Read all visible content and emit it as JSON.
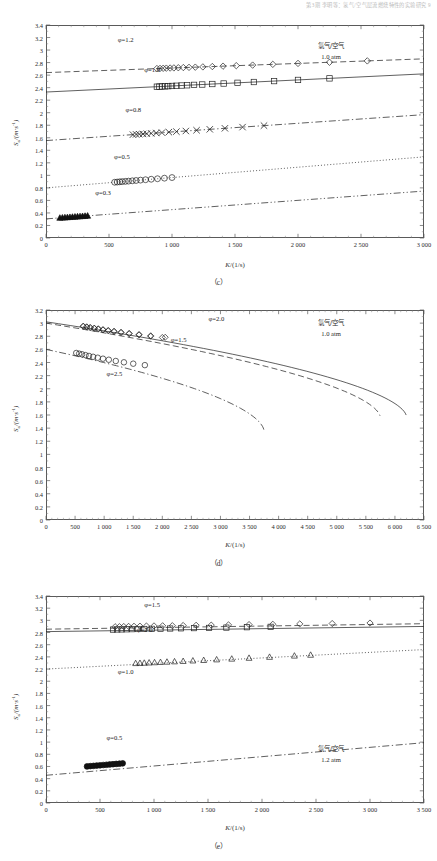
{
  "header": {
    "running_head": "第3期    李明等：氢气/空气层流燃烧特性的实验研究    9"
  },
  "figure": {
    "panels": [
      {
        "id": "c",
        "caption": "（c）",
        "xlabel_sym": "K",
        "xlabel_unit": "/(1/s)",
        "ylabel_sym": "S",
        "ylabel_sub": "u",
        "ylabel_unit": "/(m·s",
        "ylabel_sup": "-1",
        "ylabel_close": ")",
        "note_line1": "氢气/空气",
        "note_line2": "1.0 atm",
        "xticks": [
          "0",
          "500",
          "1 000",
          "1 500",
          "2 000",
          "2 500",
          "3 000"
        ],
        "yticks": [
          "0",
          "0.2",
          "0.4",
          "0.6",
          "0.8",
          "1",
          "1.2",
          "1.4",
          "1.6",
          "1.8",
          "2",
          "2.2",
          "2.4",
          "2.6",
          "2.8",
          "3",
          "3.2",
          "3.4"
        ],
        "series_labels": [
          {
            "text": "φ=1.2",
            "x": 0.19,
            "y": 0.93
          },
          {
            "text": "φ=1.0",
            "x": 0.26,
            "y": 0.79
          },
          {
            "text": "φ=0.8",
            "x": 0.21,
            "y": 0.6
          },
          {
            "text": "φ=0.5",
            "x": 0.18,
            "y": 0.38
          },
          {
            "text": "φ=0.3",
            "x": 0.13,
            "y": 0.21
          }
        ]
      },
      {
        "id": "d",
        "caption": "（d）",
        "xlabel_sym": "K",
        "xlabel_unit": "/(1/s)",
        "ylabel_sym": "S",
        "ylabel_sub": "u",
        "ylabel_unit": "/(m·s",
        "ylabel_sup": "-1",
        "ylabel_close": ")",
        "note_line1": "氢气/空气",
        "note_line2": "1.0 atm",
        "xticks": [
          "0",
          "500",
          "1 000",
          "1 500",
          "2 000",
          "2 500",
          "3 000",
          "3 500",
          "4 000",
          "4 500",
          "5 000",
          "5 500",
          "6 000",
          "6 500"
        ],
        "yticks": [
          "0",
          "0.2",
          "0.4",
          "0.6",
          "0.8",
          "1",
          "1.2",
          "1.4",
          "1.6",
          "1.8",
          "2",
          "2.2",
          "2.4",
          "2.6",
          "2.8",
          "3",
          "3.2"
        ],
        "series_labels": [
          {
            "text": "φ=2.0",
            "x": 0.43,
            "y": 0.955
          },
          {
            "text": "φ=1.5",
            "x": 0.33,
            "y": 0.855
          },
          {
            "text": "φ=2.5",
            "x": 0.16,
            "y": 0.695
          }
        ]
      },
      {
        "id": "e",
        "caption": "（e）",
        "xlabel_sym": "K",
        "xlabel_unit": "/(1/s)",
        "ylabel_sym": "S",
        "ylabel_sub": "u",
        "ylabel_unit": "/(m·s",
        "ylabel_sup": "-1",
        "ylabel_close": ")",
        "note_line1": "氢气/空气",
        "note_line2": "1.2 atm",
        "xticks": [
          "0",
          "500",
          "1 000",
          "1 500",
          "2 000",
          "2 500",
          "3 000",
          "3 500"
        ],
        "yticks": [
          "0",
          "0.2",
          "0.4",
          "0.6",
          "0.8",
          "1",
          "1.2",
          "1.4",
          "1.6",
          "1.8",
          "2",
          "2.2",
          "2.4",
          "2.6",
          "2.8",
          "3",
          "3.2",
          "3.4"
        ],
        "series_labels": [
          {
            "text": "φ=1.5",
            "x": 0.26,
            "y": 0.955
          },
          {
            "text": "φ=2.0",
            "x": 0.24,
            "y": 0.835
          },
          {
            "text": "φ=1.0",
            "x": 0.19,
            "y": 0.635
          },
          {
            "text": "φ=0.5",
            "x": 0.16,
            "y": 0.315
          }
        ]
      }
    ]
  },
  "chart_data": [
    {
      "type": "scatter",
      "panel": "c",
      "title": "",
      "xlabel": "K/(1/s)",
      "ylabel": "Su/(m·s-1)",
      "xlim": [
        0,
        3000
      ],
      "ylim": [
        0,
        3.4
      ],
      "xticks": [
        0,
        500,
        1000,
        1500,
        2000,
        2500,
        3000
      ],
      "yticks": [
        0,
        0.2,
        0.4,
        0.6,
        0.8,
        1,
        1.2,
        1.4,
        1.6,
        1.8,
        2,
        2.2,
        2.4,
        2.6,
        2.8,
        3,
        3.2,
        3.4
      ],
      "grid": false,
      "legend": "none",
      "annotations": [
        "氢气/空气",
        "1.0 atm"
      ],
      "series": [
        {
          "name": "φ=1.2",
          "marker": "diamond",
          "linestyle": "dashed",
          "intercept": 2.64,
          "slope": 7.33e-05,
          "x": [
            880,
            905,
            930,
            955,
            985,
            1015,
            1050,
            1090,
            1135,
            1185,
            1245,
            1320,
            1405,
            1510,
            1640,
            1800,
            2000,
            2250,
            2550
          ],
          "y": [
            2.705,
            2.707,
            2.709,
            2.711,
            2.713,
            2.715,
            2.718,
            2.721,
            2.724,
            2.727,
            2.731,
            2.737,
            2.743,
            2.751,
            2.76,
            2.772,
            2.787,
            2.805,
            2.827
          ]
        },
        {
          "name": "φ=1.0",
          "marker": "square",
          "linestyle": "solid",
          "intercept": 2.33,
          "slope": 9.67e-05,
          "x": [
            880,
            900,
            920,
            945,
            970,
            1000,
            1035,
            1075,
            1120,
            1175,
            1240,
            1320,
            1410,
            1520,
            1650,
            1810,
            2000,
            2250
          ],
          "y": [
            2.415,
            2.417,
            2.419,
            2.421,
            2.424,
            2.427,
            2.43,
            2.434,
            2.438,
            2.444,
            2.45,
            2.458,
            2.466,
            2.477,
            2.49,
            2.505,
            2.523,
            2.548
          ]
        },
        {
          "name": "φ=0.8",
          "marker": "x",
          "linestyle": "dashdot",
          "intercept": 1.555,
          "slope": 0.000138,
          "x": [
            690,
            715,
            740,
            770,
            800,
            835,
            875,
            920,
            975,
            1035,
            1110,
            1195,
            1300,
            1420,
            1560,
            1730
          ],
          "y": [
            1.65,
            1.654,
            1.657,
            1.661,
            1.665,
            1.67,
            1.676,
            1.682,
            1.69,
            1.698,
            1.708,
            1.72,
            1.735,
            1.751,
            1.77,
            1.794
          ]
        },
        {
          "name": "φ=0.5",
          "marker": "circle",
          "linestyle": "dotted",
          "intercept": 0.8,
          "slope": 0.000165,
          "x": [
            545,
            565,
            585,
            605,
            630,
            655,
            685,
            715,
            750,
            790,
            835,
            885,
            940,
            1000
          ],
          "y": [
            0.89,
            0.893,
            0.897,
            0.9,
            0.904,
            0.908,
            0.913,
            0.918,
            0.924,
            0.93,
            0.938,
            0.946,
            0.955,
            0.965
          ]
        },
        {
          "name": "φ=0.3",
          "marker": "triangle-filled",
          "linestyle": "dashdotdot",
          "intercept": 0.305,
          "slope": 0.000148,
          "x": [
            110,
            130,
            150,
            170,
            190,
            210,
            230,
            250,
            270,
            290,
            310,
            330
          ],
          "y": [
            0.321,
            0.324,
            0.327,
            0.33,
            0.333,
            0.336,
            0.339,
            0.342,
            0.345,
            0.348,
            0.351,
            0.354
          ]
        }
      ]
    },
    {
      "type": "scatter",
      "panel": "d",
      "title": "",
      "xlabel": "K/(1/s)",
      "ylabel": "Su/(m·s-1)",
      "xlim": [
        0,
        6500
      ],
      "ylim": [
        0,
        3.2
      ],
      "xticks": [
        0,
        500,
        1000,
        1500,
        2000,
        2500,
        3000,
        3500,
        4000,
        4500,
        5000,
        5500,
        6000,
        6500
      ],
      "yticks": [
        0,
        0.2,
        0.4,
        0.6,
        0.8,
        1,
        1.2,
        1.4,
        1.6,
        1.8,
        2,
        2.2,
        2.4,
        2.6,
        2.8,
        3,
        3.2
      ],
      "grid": false,
      "legend": "none",
      "annotations": [
        "氢气/空气",
        "1.0 atm"
      ],
      "note": "C-shaped (turning-point) extinction curves; markers on upper branch only",
      "series": [
        {
          "name": "φ=2.0",
          "marker": "diamond",
          "linestyle": "solid",
          "turning_K": 6200,
          "S0": 3.02,
          "x": [
            640,
            700,
            760,
            830,
            900,
            980,
            1070,
            1170,
            1290,
            1430,
            1600,
            1800,
            2050
          ],
          "y": [
            2.955,
            2.945,
            2.935,
            2.925,
            2.915,
            2.903,
            2.89,
            2.878,
            2.862,
            2.845,
            2.828,
            2.808,
            2.785
          ]
        },
        {
          "name": "φ=1.5",
          "marker": "diamond",
          "linestyle": "dashed",
          "turning_K": 5750,
          "S0": 3.0,
          "x": [
            640,
            700,
            760,
            830,
            900,
            980,
            1070,
            1170,
            1290,
            1430,
            1600,
            1800,
            2000
          ],
          "y": [
            2.95,
            2.94,
            2.93,
            2.92,
            2.908,
            2.896,
            2.883,
            2.87,
            2.855,
            2.838,
            2.82,
            2.8,
            2.782
          ]
        },
        {
          "name": "φ=2.5",
          "marker": "circle",
          "linestyle": "dashdot",
          "turning_K": 3750,
          "S0": 2.6,
          "x": [
            520,
            570,
            620,
            680,
            740,
            810,
            890,
            980,
            1080,
            1200,
            1340,
            1500,
            1700
          ],
          "y": [
            2.545,
            2.535,
            2.525,
            2.512,
            2.5,
            2.487,
            2.473,
            2.458,
            2.442,
            2.423,
            2.403,
            2.382,
            2.36
          ]
        }
      ]
    },
    {
      "type": "scatter",
      "panel": "e",
      "title": "",
      "xlabel": "K/(1/s)",
      "ylabel": "Su/(m·s-1)",
      "xlim": [
        0,
        3500
      ],
      "ylim": [
        0,
        3.4
      ],
      "xticks": [
        0,
        500,
        1000,
        1500,
        2000,
        2500,
        3000,
        3500
      ],
      "yticks": [
        0,
        0.2,
        0.4,
        0.6,
        0.8,
        1,
        1.2,
        1.4,
        1.6,
        1.8,
        2,
        2.2,
        2.4,
        2.6,
        2.8,
        3,
        3.2,
        3.4
      ],
      "grid": false,
      "legend": "none",
      "annotations": [
        "氢气/空气",
        "1.2 atm"
      ],
      "series": [
        {
          "name": "φ=1.5",
          "marker": "diamond",
          "linestyle": "dashed",
          "intercept": 2.855,
          "slope": 2.57e-05,
          "x": [
            640,
            680,
            720,
            765,
            815,
            870,
            930,
            1000,
            1080,
            1170,
            1270,
            1390,
            1530,
            1690,
            1880,
            2100,
            2350,
            2650,
            3000
          ],
          "y": [
            2.895,
            2.897,
            2.899,
            2.901,
            2.903,
            2.905,
            2.907,
            2.909,
            2.911,
            2.913,
            2.916,
            2.919,
            2.922,
            2.926,
            2.931,
            2.936,
            2.942,
            2.948,
            2.956
          ]
        },
        {
          "name": "φ=2.0",
          "marker": "square",
          "linestyle": "solid",
          "intercept": 2.815,
          "slope": 2.43e-05,
          "x": [
            620,
            660,
            700,
            745,
            795,
            850,
            910,
            980,
            1060,
            1150,
            1250,
            1370,
            1510,
            1670,
            1860,
            2080
          ],
          "y": [
            2.848,
            2.85,
            2.851,
            2.853,
            2.855,
            2.857,
            2.859,
            2.861,
            2.863,
            2.866,
            2.869,
            2.872,
            2.876,
            2.881,
            2.887,
            2.894
          ]
        },
        {
          "name": "φ=1.0",
          "marker": "triangle",
          "linestyle": "dotted",
          "intercept": 2.2,
          "slope": 9.14e-05,
          "x": [
            830,
            870,
            910,
            955,
            1005,
            1060,
            1120,
            1190,
            1270,
            1360,
            1460,
            1580,
            1720,
            1880,
            2070,
            2300,
            2450
          ],
          "y": [
            2.295,
            2.298,
            2.301,
            2.305,
            2.309,
            2.313,
            2.318,
            2.324,
            2.33,
            2.338,
            2.346,
            2.356,
            2.368,
            2.382,
            2.398,
            2.418,
            2.432
          ]
        },
        {
          "name": "φ=0.5",
          "marker": "circle-filled",
          "linestyle": "dashdot",
          "intercept": 0.455,
          "slope": 0.000153,
          "x": [
            380,
            410,
            440,
            470,
            500,
            530,
            560,
            590,
            620,
            650,
            680,
            710
          ],
          "y": [
            0.601,
            0.606,
            0.61,
            0.615,
            0.619,
            0.624,
            0.628,
            0.633,
            0.637,
            0.642,
            0.646,
            0.651
          ]
        }
      ]
    }
  ]
}
